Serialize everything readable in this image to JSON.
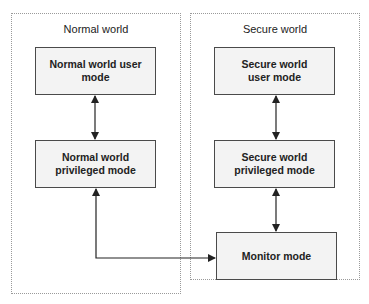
{
  "panels": {
    "normal": {
      "title": "Normal world"
    },
    "secure": {
      "title": "Secure world"
    }
  },
  "boxes": {
    "normal_user": {
      "label": "Normal world user\nmode"
    },
    "normal_priv": {
      "label": "Normal world\nprivileged mode"
    },
    "secure_user": {
      "label": "Secure world\nuser mode"
    },
    "secure_priv": {
      "label": "Secure world\nprivileged mode"
    },
    "monitor": {
      "label": "Monitor mode"
    }
  },
  "colors": {
    "panel_border": "#9a9a9a",
    "box_border": "#4a4a4a",
    "box_fill": "#f3f3f3",
    "arrow": "#222222"
  },
  "connections": [
    {
      "from": "normal_user",
      "to": "normal_priv",
      "type": "bidirectional"
    },
    {
      "from": "secure_user",
      "to": "secure_priv",
      "type": "bidirectional"
    },
    {
      "from": "secure_priv",
      "to": "monitor",
      "type": "bidirectional"
    },
    {
      "from": "normal_priv",
      "to": "monitor",
      "type": "bidirectional"
    }
  ]
}
